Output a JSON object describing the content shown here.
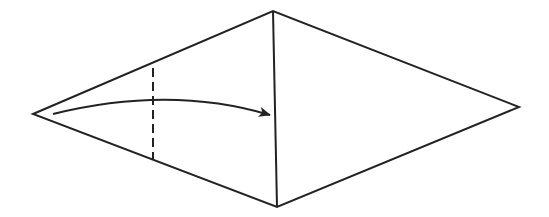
{
  "diagram": {
    "type": "origami-fold-step",
    "colors": {
      "background": "#ffffff",
      "stroke": "#222222"
    },
    "shape": {
      "name": "kite",
      "vertices": {
        "left": [
          33,
          114
        ],
        "top": [
          273,
          11
        ],
        "bottom": [
          277,
          207
        ],
        "right": [
          519,
          107
        ]
      }
    },
    "center_crease": {
      "from": [
        273,
        11
      ],
      "to": [
        277,
        207
      ]
    },
    "valley_fold_line": {
      "style": "dashed",
      "from": [
        153,
        68
      ],
      "to": [
        153,
        159
      ]
    },
    "fold_arrow": {
      "from": [
        53,
        114
      ],
      "control": [
        170,
        85
      ],
      "to": [
        270,
        115
      ],
      "direction": "left-to-right"
    }
  }
}
